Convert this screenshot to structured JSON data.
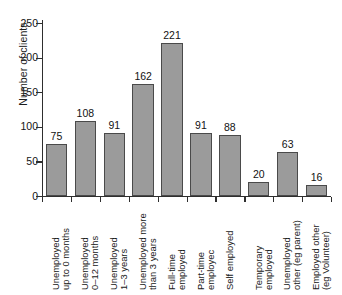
{
  "chart_data": {
    "type": "bar",
    "title": "",
    "xlabel": "",
    "ylabel": "Number of clients",
    "ylim": [
      0,
      250
    ],
    "yticks": [
      0,
      50,
      100,
      150,
      200,
      250
    ],
    "grid": false,
    "legend": null,
    "orientation": "vertical",
    "bar_color": "#9b9b9b",
    "bar_edge_color": "#4a4a4a",
    "value_labels_shown": true,
    "category_label_rotation": 90,
    "categories": [
      "Unemployed up to 0 months",
      "Unemployed 0–12 months",
      "Unemployed 1–3 years",
      "Unemployed more than 3 years",
      "Full-time employed",
      "Part-time employec",
      "Self employed",
      "Temporary employed",
      "Unemployed other (eg parent)",
      "Employed other (eg Volunteer)"
    ],
    "category_lines": [
      [
        "Unemployed",
        "up to 0 months"
      ],
      [
        "Unemployed",
        "0–12 months"
      ],
      [
        "Unemployed",
        "1–3 years"
      ],
      [
        "Unemployed more",
        "than 3 years"
      ],
      [
        "Full-time",
        "employed"
      ],
      [
        "Part-time",
        "employec"
      ],
      [
        "Self employed",
        ""
      ],
      [
        "Temporary",
        "employed"
      ],
      [
        "Unemployed",
        "other (eg parent)"
      ],
      [
        "Employed other",
        "(eg Volunteer)"
      ]
    ],
    "values": [
      75,
      108,
      91,
      162,
      221,
      91,
      88,
      20,
      63,
      16
    ]
  }
}
